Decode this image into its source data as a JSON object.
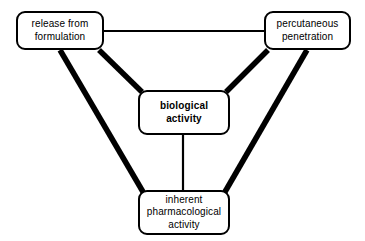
{
  "diagram": {
    "background_color": "#ffffff",
    "line_color": "#000000",
    "nodes": [
      {
        "id": "release",
        "label": "release from\nformulation",
        "emphasis": "normal"
      },
      {
        "id": "percutaneous",
        "label": "percutaneous\npenetration",
        "emphasis": "normal"
      },
      {
        "id": "biological",
        "label": "biological\nactivity",
        "emphasis": "bold"
      },
      {
        "id": "inherent",
        "label": "inherent\npharmacological\nactivity",
        "emphasis": "normal"
      }
    ],
    "connectors": [
      {
        "id": "release-percutaneous",
        "from": "release",
        "to": "percutaneous",
        "weight": "thin"
      },
      {
        "id": "release-biological",
        "from": "release",
        "to": "biological",
        "weight": "thick"
      },
      {
        "id": "release-inherent",
        "from": "release",
        "to": "inherent",
        "weight": "thick"
      },
      {
        "id": "percutaneous-biological",
        "from": "percutaneous",
        "to": "biological",
        "weight": "thick"
      },
      {
        "id": "percutaneous-inherent",
        "from": "percutaneous",
        "to": "inherent",
        "weight": "thick"
      },
      {
        "id": "biological-inherent",
        "from": "biological",
        "to": "inherent",
        "weight": "thin"
      }
    ]
  }
}
